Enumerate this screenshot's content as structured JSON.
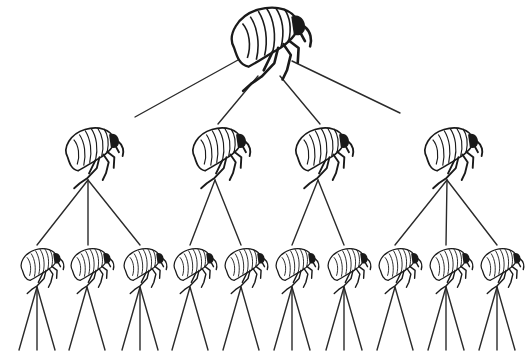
{
  "diagram": {
    "title": "",
    "line_color": "#2a2a2a",
    "background": "#ffffff",
    "nodes": {
      "root": {
        "x": 265,
        "y": 38,
        "scale": 1.45,
        "icon": "flea-icon"
      },
      "level1": [
        {
          "x": 90,
          "y": 150,
          "scale": 1.05,
          "icon": "flea-icon",
          "apex": [
            88,
            180
          ],
          "children": [
            37,
            88,
            140
          ]
        },
        {
          "x": 217,
          "y": 150,
          "scale": 1.05,
          "icon": "flea-icon",
          "apex": [
            215,
            180
          ],
          "children": [
            190,
            241
          ]
        },
        {
          "x": 320,
          "y": 150,
          "scale": 1.05,
          "icon": "flea-icon",
          "apex": [
            318,
            180
          ],
          "children": [
            292,
            344
          ]
        },
        {
          "x": 449,
          "y": 150,
          "scale": 1.05,
          "icon": "flea-icon",
          "apex": [
            447,
            180
          ],
          "children": [
            395,
            446,
            497
          ]
        }
      ],
      "level2": [
        {
          "x": 37,
          "fanout": 3
        },
        {
          "x": 87,
          "fanout": 2
        },
        {
          "x": 140,
          "fanout": 3
        },
        {
          "x": 190,
          "fanout": 2
        },
        {
          "x": 241,
          "fanout": 2
        },
        {
          "x": 292,
          "fanout": 3
        },
        {
          "x": 344,
          "fanout": 3
        },
        {
          "x": 395,
          "fanout": 2
        },
        {
          "x": 446,
          "fanout": 3
        },
        {
          "x": 497,
          "fanout": 3
        }
      ],
      "level2_y": 265,
      "level2_scale": 0.78,
      "leaf_apex_y": 287,
      "leaf_bottom_y": 350,
      "leaf_spread": 18
    },
    "root_edges": [
      {
        "from": [
          238,
          60
        ],
        "to": [
          135,
          117
        ]
      },
      {
        "from": [
          258,
          76
        ],
        "to": [
          218,
          124
        ]
      },
      {
        "from": [
          280,
          76
        ],
        "to": [
          320,
          124
        ]
      },
      {
        "from": [
          292,
          61
        ],
        "to": [
          400,
          113
        ]
      }
    ]
  }
}
